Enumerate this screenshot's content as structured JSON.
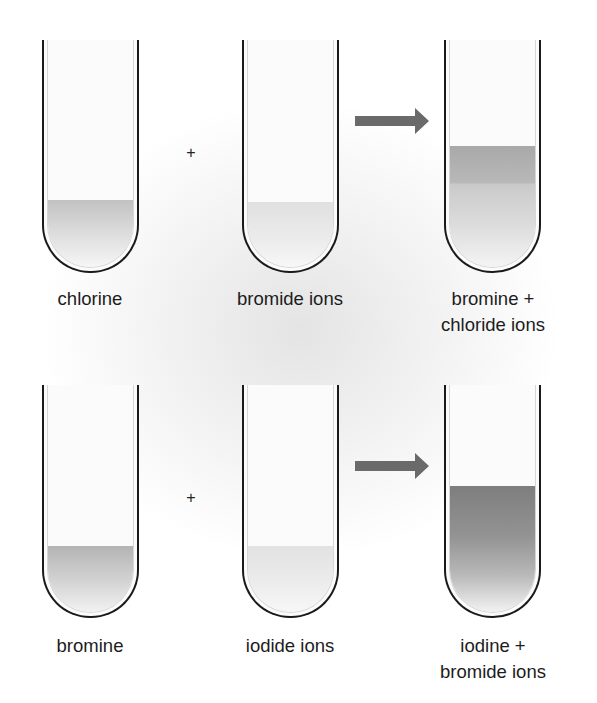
{
  "diagram": {
    "colors": {
      "tube_outline": "#1a1a1a",
      "arrow": "#6a6a6a",
      "liquid_light": "#c4c4c4",
      "liquid_medium": "#a8a8a8",
      "liquid_dark": "#7e7e7e"
    },
    "reactions": [
      {
        "reactant1": {
          "label": "chlorine",
          "liquid_level_pct": 30,
          "shade": "medium"
        },
        "operator": "+",
        "reactant2": {
          "label": "bromide ions",
          "liquid_level_pct": 29,
          "shade": "light"
        },
        "arrow": "arrow-right",
        "product": {
          "label_line1": "bromine +",
          "label_line2": "chloride ions",
          "liquid_level_pct": 53,
          "shade": "medium"
        }
      },
      {
        "reactant1": {
          "label": "bromine",
          "liquid_level_pct": 29,
          "shade": "medium"
        },
        "operator": "+",
        "reactant2": {
          "label": "iodide ions",
          "liquid_level_pct": 29,
          "shade": "light"
        },
        "arrow": "arrow-right",
        "product": {
          "label_line1": "iodine +",
          "label_line2": "bromide ions",
          "liquid_level_pct": 55,
          "shade": "dark"
        }
      }
    ]
  }
}
